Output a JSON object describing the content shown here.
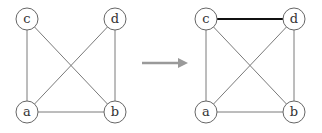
{
  "diagram": {
    "type": "graph-transformation",
    "colors": {
      "edge": "#7a7a7a",
      "highlight_edge": "#111111",
      "node_stroke": "#666666",
      "arrow": "#9a9a9a"
    },
    "before": {
      "nodes": [
        {
          "id": "c",
          "label": "c",
          "x": 27,
          "y": 19
        },
        {
          "id": "d",
          "label": "d",
          "x": 115,
          "y": 19
        },
        {
          "id": "a",
          "label": "a",
          "x": 27,
          "y": 112
        },
        {
          "id": "b",
          "label": "b",
          "x": 115,
          "y": 112
        }
      ],
      "edges": [
        {
          "from": "c",
          "to": "a"
        },
        {
          "from": "c",
          "to": "b"
        },
        {
          "from": "d",
          "to": "a"
        },
        {
          "from": "d",
          "to": "b"
        },
        {
          "from": "a",
          "to": "b"
        }
      ]
    },
    "after": {
      "nodes": [
        {
          "id": "c",
          "label": "c",
          "x": 206,
          "y": 19
        },
        {
          "id": "d",
          "label": "d",
          "x": 294,
          "y": 19
        },
        {
          "id": "a",
          "label": "a",
          "x": 206,
          "y": 112
        },
        {
          "id": "b",
          "label": "b",
          "x": 294,
          "y": 112
        }
      ],
      "edges": [
        {
          "from": "c",
          "to": "a"
        },
        {
          "from": "c",
          "to": "b"
        },
        {
          "from": "d",
          "to": "a"
        },
        {
          "from": "d",
          "to": "b"
        },
        {
          "from": "a",
          "to": "b"
        },
        {
          "from": "c",
          "to": "d",
          "highlight": true
        }
      ]
    },
    "arrow": {
      "x1": 142,
      "x2": 188,
      "y": 63
    }
  }
}
